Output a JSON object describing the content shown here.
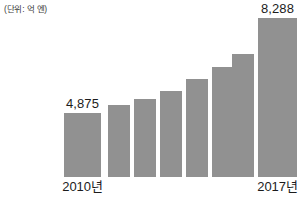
{
  "chart_data": {
    "type": "bar",
    "title": "",
    "subtitle": "",
    "unit_label": "(단위: 억 엔)",
    "xlabel": "",
    "ylabel": "",
    "grid": false,
    "legend": false,
    "ylim": [
      0,
      8288
    ],
    "axis_visible": false,
    "categories": [
      "2010년",
      "2011년",
      "2012년",
      "2013년",
      "2014년",
      "2015년",
      "2016년",
      "2017년"
    ],
    "tick_labels_shown": [
      "2010년",
      "",
      "",
      "",
      "",
      "",
      "",
      "2017년"
    ],
    "values": [
      4875,
      5200,
      5500,
      5900,
      6500,
      7000,
      7700,
      8288
    ],
    "data_labels_shown": [
      "4,875",
      "",
      "",
      "",
      "",
      "",
      "",
      "8,288"
    ],
    "series": [
      {
        "name": "매출액",
        "values": [
          4875,
          5200,
          5500,
          5900,
          6500,
          7000,
          7700,
          8288
        ]
      }
    ],
    "bar_color": "#919191",
    "background_color": "#ffffff",
    "text_color": "#1c1c1c"
  },
  "bars": [
    {
      "category": "2010년",
      "value": 4875,
      "value_label": "4,875",
      "axis_label": "2010년",
      "show_value_label": true,
      "show_axis_label": true,
      "left": 64,
      "width": 37,
      "height": 64
    },
    {
      "category": "2011년",
      "value": 5200,
      "value_label": "5,200",
      "axis_label": "2011년",
      "show_value_label": false,
      "show_axis_label": false,
      "left": 108,
      "width": 22,
      "height": 72
    },
    {
      "category": "2012년",
      "value": 5500,
      "value_label": "5,500",
      "axis_label": "2012년",
      "show_value_label": false,
      "show_axis_label": false,
      "left": 134,
      "width": 22,
      "height": 78
    },
    {
      "category": "2013년",
      "value": 5900,
      "value_label": "5,900",
      "axis_label": "2013년",
      "show_value_label": false,
      "show_axis_label": false,
      "left": 160,
      "width": 22,
      "height": 86
    },
    {
      "category": "2014년",
      "value": 6500,
      "value_label": "6,500",
      "axis_label": "2014년",
      "show_value_label": false,
      "show_axis_label": false,
      "left": 186,
      "width": 22,
      "height": 98
    },
    {
      "category": "2015년",
      "value": 7000,
      "value_label": "7,000",
      "axis_label": "2015년",
      "show_value_label": false,
      "show_axis_label": false,
      "left": 212,
      "width": 22,
      "height": 110
    },
    {
      "category": "2016년",
      "value": 7700,
      "value_label": "7,700",
      "axis_label": "2016년",
      "show_value_label": false,
      "show_axis_label": false,
      "left": 232,
      "width": 22,
      "height": 123
    },
    {
      "category": "2017년",
      "value": 8288,
      "value_label": "8,288",
      "axis_label": "2017년",
      "show_value_label": true,
      "show_axis_label": true,
      "left": 258,
      "width": 39,
      "height": 159
    }
  ]
}
